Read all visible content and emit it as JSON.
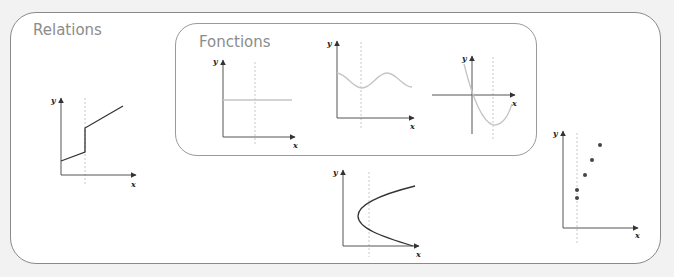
{
  "diagram": {
    "outer_label": "Relations",
    "inner_label": "Fonctions",
    "colors": {
      "frame": "#8a8a8a",
      "title": "#8c8c8c",
      "function_curve": "#c4c4c4",
      "relation_curve": "#333333",
      "background": "#f2f2f2"
    },
    "graphs": [
      {
        "id": "constant-function",
        "group": "Fonctions",
        "kind": "horizontal line",
        "x_label": "x",
        "y_label": "y"
      },
      {
        "id": "wave-function",
        "group": "Fonctions",
        "kind": "sinusoidal curve",
        "x_label": "x",
        "y_label": "y"
      },
      {
        "id": "parabola-function",
        "group": "Fonctions",
        "kind": "upward parabola",
        "x_label": "x",
        "y_label": "y"
      },
      {
        "id": "step-relation",
        "group": "Relations",
        "kind": "piecewise line with vertical jump",
        "x_label": "x",
        "y_label": "y"
      },
      {
        "id": "sideways-parabola-relation",
        "group": "Relations",
        "kind": "sideways parabola",
        "x_label": "x",
        "y_label": "y"
      },
      {
        "id": "scatter-relation",
        "group": "Relations",
        "kind": "scatter points",
        "x_label": "x",
        "y_label": "y",
        "point_count": 5
      }
    ]
  }
}
